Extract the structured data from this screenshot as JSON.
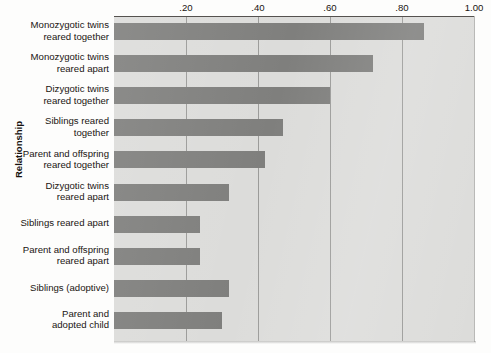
{
  "chart_data": {
    "type": "bar",
    "orientation": "horizontal",
    "title": "",
    "xlabel": "",
    "ylabel": "Relationship",
    "xlim": [
      0,
      1.0
    ],
    "grid": true,
    "legend": "none",
    "bar_color": "#7f7f7d",
    "plot_background": "#dcdcda",
    "xticks": [
      {
        "value": 0.2,
        "label": ".20"
      },
      {
        "value": 0.4,
        "label": ".40"
      },
      {
        "value": 0.6,
        "label": ".60"
      },
      {
        "value": 0.8,
        "label": ".80"
      },
      {
        "value": 1.0,
        "label": "1.00"
      }
    ],
    "categories": [
      "Monozygotic twins\nreared together",
      "Monozygotic twins\nreared apart",
      "Dizygotic twins\nreared together",
      "Siblings reared\ntogether",
      "Parent and offspring\nreared together",
      "Dizygotic twins\nreared apart",
      "Siblings reared apart",
      "Parent and offspring\nreared apart",
      "Siblings (adoptive)",
      "Parent and\nadopted child"
    ],
    "values": [
      0.86,
      0.72,
      0.6,
      0.47,
      0.42,
      0.32,
      0.24,
      0.24,
      0.32,
      0.3
    ]
  }
}
